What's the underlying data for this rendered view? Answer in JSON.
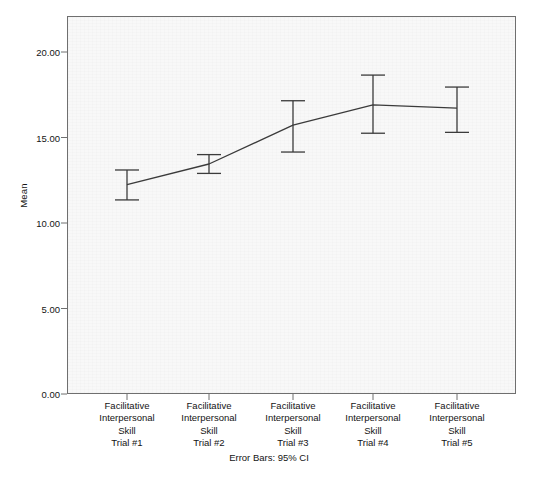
{
  "chart_data": {
    "type": "line",
    "title": "",
    "xlabel": "",
    "ylabel": "Mean",
    "ylim": [
      0,
      22.9
    ],
    "grid": false,
    "legend": null,
    "error_bar_type": "95% CI",
    "categories": [
      "Facilitative Interpersonal Skill Trial #1",
      "Facilitative Interpersonal Skill Trial #2",
      "Facilitative Interpersonal Skill Trial #3",
      "Facilitative Interpersonal Skill Trial #4",
      "Facilitative Interpersonal Skill Trial #5"
    ],
    "values": [
      12.25,
      13.45,
      15.72,
      16.91,
      16.72
    ],
    "ci_lower": [
      11.35,
      12.9,
      14.15,
      15.25,
      15.3
    ],
    "ci_upper": [
      13.1,
      14.0,
      17.15,
      18.65,
      17.95
    ],
    "yticks": [
      0,
      5,
      10,
      15,
      20
    ],
    "ytick_labels": [
      "0.00",
      "5.00",
      "10.00",
      "15.00",
      "20.00"
    ],
    "series_color": "#3b3b3b"
  },
  "axes": {
    "y_title": "Mean",
    "y_ticks": [
      {
        "value": 20,
        "label": "20.00"
      },
      {
        "value": 15,
        "label": "15.00"
      },
      {
        "value": 10,
        "label": "10.00"
      },
      {
        "value": 5,
        "label": "5.00"
      },
      {
        "value": 0,
        "label": "0.00"
      }
    ],
    "x_categories": [
      {
        "line1": "Facilitative",
        "line2": "Interpersonal",
        "line3": "Skill",
        "line4": "Trial #1"
      },
      {
        "line1": "Facilitative",
        "line2": "Interpersonal",
        "line3": "Skill",
        "line4": "Trial #2"
      },
      {
        "line1": "Facilitative",
        "line2": "Interpersonal",
        "line3": "Skill",
        "line4": "Trial #3"
      },
      {
        "line1": "Facilitative",
        "line2": "Interpersonal",
        "line3": "Skill",
        "line4": "Trial #4"
      },
      {
        "line1": "Facilitative",
        "line2": "Interpersonal",
        "line3": "Skill",
        "line4": "Trial #5"
      }
    ]
  },
  "footnote": "Error Bars: 95% CI"
}
